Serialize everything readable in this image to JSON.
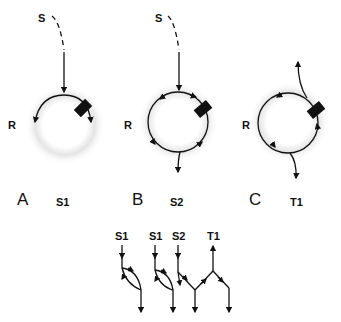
{
  "panels": [
    {
      "letter": "A",
      "source_label": "S",
      "ring_label": "R",
      "product_label": "S1"
    },
    {
      "letter": "B",
      "source_label": "S",
      "ring_label": "R",
      "product_label": "S2"
    },
    {
      "letter": "C",
      "ring_label": "R",
      "product_label": "T1"
    }
  ],
  "schematic": {
    "labels": [
      "S1",
      "S1",
      "S2",
      "T1"
    ]
  },
  "colors": {
    "stroke": "#111111",
    "halo": "#e6e6e6"
  }
}
